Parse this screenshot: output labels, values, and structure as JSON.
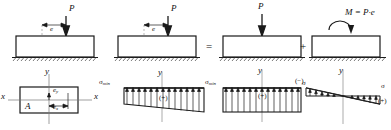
{
  "diagram": {
    "colors": {
      "line": "#1a1a1a",
      "fill": "#ffffff",
      "hatch": "#555555"
    },
    "operators": {
      "equals": "=",
      "plus": "+"
    },
    "panels": [
      {
        "id": "eccentric-load",
        "load_label": "P",
        "eccentricity_label": "e",
        "section": {
          "axis_x_label": "x",
          "axis_y_label": "y",
          "corner_label": "A",
          "ecc_y_label": "e",
          "ecc_y_sub": "y",
          "ecc_x_label": "e",
          "ecc_x_sub": "x"
        }
      },
      {
        "id": "eccentric-load-repeat",
        "load_label": "P",
        "eccentricity_label": "e",
        "stress": {
          "axis_y_label": "y",
          "left_label": "σ",
          "left_sub": "min",
          "right_label": "σ",
          "right_sub": "min",
          "sign": "(+)"
        }
      },
      {
        "id": "centric-load",
        "load_label": "P",
        "stress": {
          "axis_y_label": "y",
          "label": "σ",
          "sign": "(+)"
        }
      },
      {
        "id": "pure-moment",
        "moment_label": "M = P·e",
        "stress": {
          "axis_y_label": "y",
          "label": "σ",
          "sign_negative": "(−)",
          "sign_positive": "(+)"
        }
      }
    ]
  }
}
